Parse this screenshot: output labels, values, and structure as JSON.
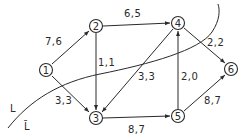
{
  "diagram": {
    "type": "flow-network",
    "colors": {
      "ink": "#2a2a2a",
      "background": "#ffffff"
    },
    "nodes": [
      {
        "id": "1",
        "label": "1",
        "x": 46,
        "y": 70
      },
      {
        "id": "2",
        "label": "2",
        "x": 96,
        "y": 26
      },
      {
        "id": "3",
        "label": "3",
        "x": 96,
        "y": 118
      },
      {
        "id": "4",
        "label": "4",
        "x": 178,
        "y": 23
      },
      {
        "id": "5",
        "label": "5",
        "x": 178,
        "y": 116
      },
      {
        "id": "6",
        "label": "6",
        "x": 231,
        "y": 69
      }
    ],
    "edges": [
      {
        "from": "1",
        "to": "2",
        "label": "7,6"
      },
      {
        "from": "1",
        "to": "3",
        "label": "3,3"
      },
      {
        "from": "2",
        "to": "4",
        "label": "6,5"
      },
      {
        "from": "2",
        "to": "3",
        "label": "1,1"
      },
      {
        "from": "4",
        "to": "3",
        "label": "3,3"
      },
      {
        "from": "4",
        "to": "6",
        "label": "2,2"
      },
      {
        "from": "3",
        "to": "5",
        "label": "8,7"
      },
      {
        "from": "5",
        "to": "4",
        "label": "2,0"
      },
      {
        "from": "5",
        "to": "6",
        "label": "8,7"
      }
    ],
    "cut": {
      "side_label": "L",
      "complement_label": "L̄"
    }
  }
}
